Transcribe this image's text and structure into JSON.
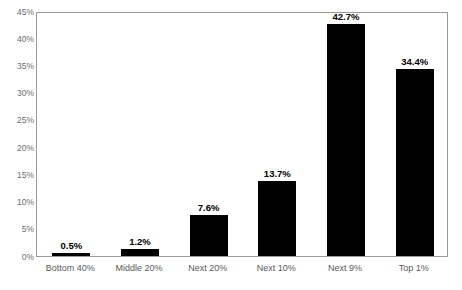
{
  "chart_data": {
    "type": "bar",
    "title": "",
    "xlabel": "",
    "ylabel": "",
    "categories": [
      "Bottom 40%",
      "Middle 20%",
      "Next 20%",
      "Next 10%",
      "Next 9%",
      "Top 1%"
    ],
    "values": [
      0.5,
      1.2,
      7.6,
      13.7,
      42.7,
      34.4
    ],
    "value_labels": [
      "0.5%",
      "1.2%",
      "7.6%",
      "13.7%",
      "42.7%",
      "34.4%"
    ],
    "ylim": [
      0,
      45
    ],
    "ytick_values": [
      0,
      5,
      10,
      15,
      20,
      25,
      30,
      35,
      40,
      45
    ],
    "ytick_labels": [
      "0%",
      "5%",
      "10%",
      "15%",
      "20%",
      "25%",
      "30%",
      "35%",
      "40%",
      "45%"
    ],
    "grid": false,
    "legend": null,
    "bar_color": "#000000",
    "frame_color": "#9a9a9a",
    "tick_label_color": "#6e6e6e",
    "category_label_color": "#5a5a5a",
    "value_label_color": "#000000",
    "plot_background": "#ffffff"
  }
}
